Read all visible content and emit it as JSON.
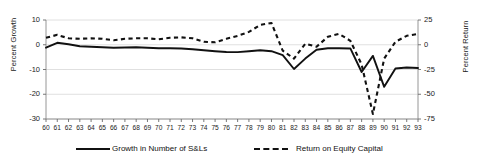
{
  "chart_data": {
    "type": "line",
    "title": "",
    "xlabel": "",
    "ylabel": "Percent Growth",
    "y2label": "Percent Return",
    "grid": true,
    "legend_position": "bottom",
    "x": [
      "60",
      "61",
      "62",
      "63",
      "64",
      "65",
      "66",
      "67",
      "68",
      "69",
      "70",
      "71",
      "72",
      "73",
      "74",
      "75",
      "76",
      "77",
      "78",
      "79",
      "80",
      "81",
      "82",
      "83",
      "84",
      "85",
      "86",
      "87",
      "88",
      "89",
      "90",
      "91",
      "92",
      "93"
    ],
    "xticklabels": [
      "60",
      "61",
      "62",
      "63",
      "64",
      "65",
      "66",
      "67",
      "68",
      "69",
      "70",
      "71",
      "72",
      "73",
      "74",
      "75",
      "76",
      "77",
      "78",
      "79",
      "80",
      "81",
      "82",
      "83",
      "84",
      "85",
      "86",
      "87",
      "88",
      "89",
      "90",
      "91",
      "92",
      "93"
    ],
    "ylim": [
      -30,
      10
    ],
    "yticks": [
      10,
      0,
      -10,
      -20,
      -30
    ],
    "yticklabels": [
      "10",
      "0",
      "-10",
      "-20",
      "-30"
    ],
    "y2lim": [
      -75,
      25
    ],
    "y2ticks": [
      25,
      0,
      -25,
      -50,
      -75
    ],
    "y2ticklabels": [
      "25",
      "0",
      "-25",
      "-50",
      "-75"
    ],
    "series": [
      {
        "name": "Growth in Number of S&Ls",
        "axis": "left",
        "style": "solid",
        "color": "#111111",
        "values": [
          -1.2,
          0.8,
          0.2,
          -0.6,
          -0.8,
          -1.0,
          -1.2,
          -1.1,
          -1.0,
          -1.2,
          -1.4,
          -1.4,
          -1.5,
          -1.8,
          -2.2,
          -2.6,
          -2.9,
          -3.0,
          -2.6,
          -2.2,
          -2.6,
          -4.2,
          -9.8,
          -5.6,
          -2.0,
          -1.4,
          -1.4,
          -1.5,
          -11.0,
          -4.5,
          -17.0,
          -9.6,
          -9.2,
          -9.4
        ]
      },
      {
        "name": "Return on Equity Capital",
        "axis": "right",
        "style": "dashed",
        "color": "#111111",
        "values": [
          7.0,
          10.0,
          6.5,
          6.0,
          6.5,
          6.0,
          4.5,
          6.0,
          6.5,
          6.5,
          5.5,
          7.0,
          7.5,
          6.5,
          3.0,
          2.5,
          6.0,
          9.0,
          13.0,
          20.0,
          22.0,
          -6.0,
          -14.0,
          1.0,
          -2.0,
          8.0,
          11.0,
          4.0,
          -20.0,
          -70.0,
          -14.0,
          3.0,
          9.0,
          11.0
        ]
      }
    ],
    "annotations": []
  },
  "legend": {
    "items": [
      {
        "label": "Growth in Number of S&Ls",
        "marker": "solid-line-swatch"
      },
      {
        "label": "Return on Equity Capital",
        "marker": "dashed-line-swatch"
      }
    ]
  }
}
